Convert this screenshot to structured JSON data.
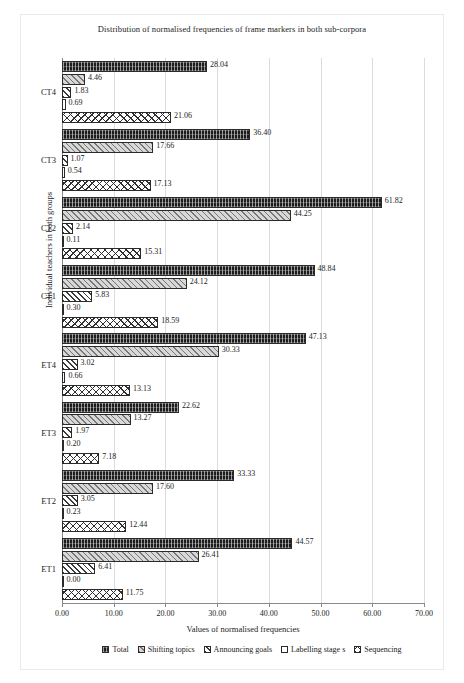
{
  "chart_data": {
    "type": "bar",
    "orientation": "horizontal",
    "title": "Distribution of normalised frequencies of frame markers in both sub-corpora",
    "xlabel": "Values of normalised frequencies",
    "ylabel": "Individual teachers in both groups",
    "xlim": [
      0,
      70
    ],
    "xticks": [
      "0.00",
      "10.00",
      "20.00",
      "30.00",
      "40.00",
      "50.00",
      "60.00",
      "70.00"
    ],
    "xtick_values": [
      0,
      10,
      20,
      30,
      40,
      50,
      60,
      70
    ],
    "grid": "vertical",
    "legend_position": "bottom",
    "categories": [
      "CT4",
      "CT3",
      "CT2",
      "CT1",
      "ET4",
      "ET3",
      "ET2",
      "ET1"
    ],
    "series": [
      {
        "name": "Total",
        "key": "total",
        "pattern": "dark-vertical-stripes",
        "values": [
          28.04,
          36.4,
          61.82,
          48.84,
          47.13,
          22.62,
          33.33,
          44.57
        ]
      },
      {
        "name": "Shifting topics",
        "key": "shift",
        "pattern": "grey-diagonal-hatch",
        "values": [
          4.46,
          17.66,
          44.25,
          24.12,
          30.33,
          13.27,
          17.6,
          26.41
        ]
      },
      {
        "name": "Announcing goals",
        "key": "announce",
        "pattern": "diagonal-lines",
        "values": [
          1.83,
          1.07,
          2.14,
          5.83,
          3.02,
          1.97,
          3.05,
          6.41
        ]
      },
      {
        "name": "Labelling stage s",
        "key": "label",
        "pattern": "solid-white",
        "values": [
          0.69,
          0.54,
          0.11,
          0.3,
          0.66,
          0.2,
          0.23,
          0.0
        ]
      },
      {
        "name": "Sequencing",
        "key": "seq",
        "pattern": "crosshatch-diamond",
        "values": [
          21.06,
          17.13,
          15.31,
          18.59,
          13.13,
          7.18,
          12.44,
          11.75
        ]
      }
    ],
    "data_labels": {
      "CT4": [
        "28.04",
        "4.46",
        "1.83",
        "0.69",
        "21.06"
      ],
      "CT3": [
        "36.40",
        "17.66",
        "1.07",
        "0.54",
        "17.13"
      ],
      "CT2": [
        "61.82",
        "44.25",
        "2.14",
        "0.11",
        "15.31"
      ],
      "CT1": [
        "48.84",
        "24.12",
        "5.83",
        "0.30",
        "18.59"
      ],
      "ET4": [
        "47.13",
        "30.33",
        "3.02",
        "0.66",
        "13.13"
      ],
      "ET3": [
        "22.62",
        "13.27",
        "1.97",
        "0.20",
        "7.18"
      ],
      "ET2": [
        "33.33",
        "17.60",
        "3.05",
        "0.23",
        "12.44"
      ],
      "ET1": [
        "44.57",
        "26.41",
        "6.41",
        "0.00",
        "11.75"
      ]
    }
  },
  "legend": {
    "items": [
      {
        "label": "Total"
      },
      {
        "label": "Shifting topics"
      },
      {
        "label": "Announcing goals"
      },
      {
        "label": "Labelling stage s"
      },
      {
        "label": "Sequencing"
      }
    ]
  }
}
